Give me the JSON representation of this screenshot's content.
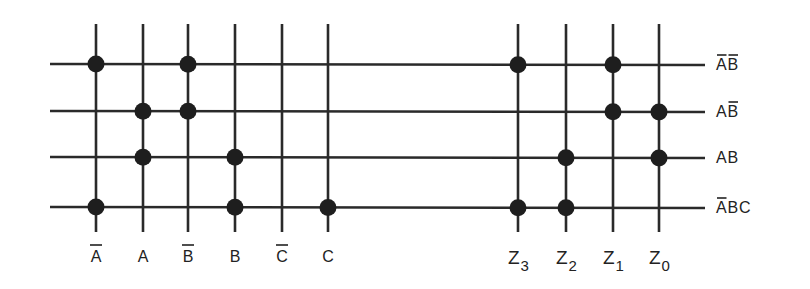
{
  "diagram": {
    "type": "PLA programmable logic array",
    "colors": {
      "line": "#2a2a2a",
      "dot": "#1e1e1e",
      "text": "#222222",
      "background": "#ffffff"
    },
    "input_columns": [
      {
        "id": "A_bar",
        "label": "A",
        "complemented": true,
        "x": 96
      },
      {
        "id": "A",
        "label": "A",
        "complemented": false,
        "x": 143
      },
      {
        "id": "B_bar",
        "label": "B",
        "complemented": true,
        "x": 188
      },
      {
        "id": "B",
        "label": "B",
        "complemented": false,
        "x": 235
      },
      {
        "id": "C_bar",
        "label": "C",
        "complemented": true,
        "x": 282
      },
      {
        "id": "C",
        "label": "C",
        "complemented": false,
        "x": 328
      }
    ],
    "output_columns": [
      {
        "id": "Z3",
        "label": "Z",
        "subscript": "3",
        "x": 518
      },
      {
        "id": "Z2",
        "label": "Z",
        "subscript": "2",
        "x": 566
      },
      {
        "id": "Z1",
        "label": "Z",
        "subscript": "1",
        "x": 613
      },
      {
        "id": "Z0",
        "label": "Z",
        "subscript": "0",
        "x": 659
      }
    ],
    "product_terms": [
      {
        "id": "notA_notB",
        "y": 64,
        "label_parts": [
          {
            "t": "A",
            "bar": true
          },
          {
            "t": "B",
            "bar": true
          }
        ],
        "inputs": [
          "A_bar",
          "B_bar"
        ],
        "outputs": [
          "Z3",
          "Z1"
        ]
      },
      {
        "id": "A_notB",
        "y": 111,
        "label_parts": [
          {
            "t": "A",
            "bar": false
          },
          {
            "t": "B",
            "bar": true
          }
        ],
        "inputs": [
          "A",
          "B_bar"
        ],
        "outputs": [
          "Z1",
          "Z0"
        ]
      },
      {
        "id": "A_B",
        "y": 157,
        "label_parts": [
          {
            "t": "A",
            "bar": false
          },
          {
            "t": "B",
            "bar": false
          }
        ],
        "inputs": [
          "A",
          "B"
        ],
        "outputs": [
          "Z2",
          "Z0"
        ]
      },
      {
        "id": "notA_B_C",
        "y": 207,
        "label_parts": [
          {
            "t": "A",
            "bar": true
          },
          {
            "t": "B",
            "bar": false
          },
          {
            "t": "C",
            "bar": false
          }
        ],
        "inputs": [
          "A_bar",
          "B",
          "C"
        ],
        "outputs": [
          "Z3",
          "Z2"
        ]
      }
    ],
    "geometry": {
      "h_line_x1": 50,
      "h_line_x2": 705,
      "v_line_y1": 24,
      "v_line_y2": 232,
      "dot_radius": 8.5,
      "line_width": 2.6,
      "bottom_label_y": 262,
      "right_label_x": 716
    }
  }
}
